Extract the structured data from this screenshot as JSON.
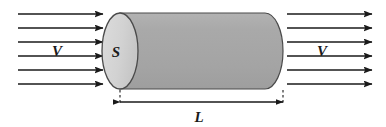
{
  "figure": {
    "background_color": "#ffffff",
    "width": 386,
    "height": 127,
    "labels": {
      "velocity_left": "V",
      "velocity_right": "V",
      "cross_section_area": "S",
      "length": "L"
    },
    "colors": {
      "cylinder_body": "#a8a8a8",
      "cylinder_cap": "#d4d4d4",
      "outline": "#4a4a4a",
      "arrow": "#1a1a1a",
      "dimension_line": "#1a1a1a",
      "text": "#1a1a1a"
    },
    "geometry": {
      "cap_center_x": 120,
      "cap_rx": 18,
      "cap_ry": 38,
      "body_left_x": 120,
      "body_right_x": 283,
      "body_top_y": 13,
      "body_bottom_y": 89
    },
    "flow_arrows_left": {
      "count": 6,
      "x_start": 18,
      "x_end": 103,
      "y_values": [
        14,
        28,
        42,
        56,
        70,
        84
      ],
      "direction": "right"
    },
    "flow_arrows_right": {
      "count": 6,
      "x_start": 292,
      "x_end": 372,
      "y_values": [
        14,
        28,
        42,
        56,
        70,
        84
      ],
      "direction": "right"
    },
    "dimension": {
      "label": "L",
      "y": 102,
      "x_left": 120,
      "x_right": 283,
      "extension_left_x": 120,
      "extension_right_x": 283,
      "extension_from_y": 90,
      "extension_to_y": 102,
      "extension_style": "dashed",
      "arrowheads": "both"
    },
    "label_positions": {
      "velocity_left": {
        "x": 57,
        "y": 55
      },
      "velocity_right": {
        "x": 322,
        "y": 55
      },
      "cross_section_area": {
        "x": 115,
        "y": 57
      },
      "length": {
        "x": 197,
        "y": 121
      }
    }
  }
}
